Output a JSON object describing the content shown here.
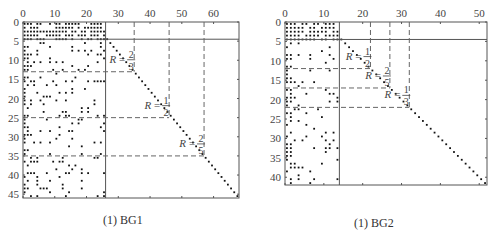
{
  "figures": [
    {
      "id": "bg1",
      "caption": "(1) BG1",
      "x_ticks": [
        "0",
        "10",
        "20",
        "30",
        "40",
        "50",
        "60"
      ],
      "y_ticks": [
        "0",
        "5",
        "10",
        "15",
        "20",
        "25",
        "30",
        "35",
        "40",
        "45"
      ],
      "rate_labels": [
        {
          "r": "R",
          "eq": "=",
          "num": "2",
          "den": "3"
        },
        {
          "r": "R",
          "eq": "=",
          "num": "1",
          "den": "2"
        },
        {
          "r": "R",
          "eq": "=",
          "num": "2",
          "den": "5"
        }
      ]
    },
    {
      "id": "bg2",
      "caption": "(1) BG2",
      "x_ticks": [
        "0",
        "10",
        "20",
        "30",
        "40",
        "50"
      ],
      "y_ticks": [
        "0",
        "5",
        "10",
        "15",
        "20",
        "25",
        "30",
        "35",
        "40"
      ],
      "rate_labels": [
        {
          "r": "R",
          "eq": "=",
          "num": "1",
          "den": "2"
        },
        {
          "r": "R",
          "eq": "=",
          "num": "2",
          "den": "5"
        },
        {
          "r": "R",
          "eq": "=",
          "num": "1",
          "den": "3"
        }
      ]
    }
  ],
  "chart_data": [
    {
      "type": "scatter",
      "title": "BG1 base graph (LDPC) non-zero pattern",
      "caption": "(1) BG1",
      "x_range": [
        0,
        68
      ],
      "y_range": [
        0,
        46
      ],
      "x_ticks": [
        0,
        10,
        20,
        30,
        40,
        50,
        60
      ],
      "y_ticks": [
        0,
        5,
        10,
        15,
        20,
        25,
        30,
        35,
        40,
        45
      ],
      "core_block": {
        "rows": [
          0,
          4
        ],
        "cols": [
          0,
          26
        ]
      },
      "info_cols": 22,
      "diagonal": {
        "from": [
          26,
          4
        ],
        "to": [
          68,
          46
        ]
      },
      "rate_cuts": [
        {
          "label": "R=2/3",
          "row": 13,
          "col": 35
        },
        {
          "label": "R=1/2",
          "row": 25,
          "col": 46
        },
        {
          "label": "R=2/5",
          "row": 35,
          "col": 57
        }
      ]
    },
    {
      "type": "scatter",
      "title": "BG2 base graph (LDPC) non-zero pattern",
      "caption": "(1) BG2",
      "x_range": [
        0,
        52
      ],
      "y_range": [
        0,
        42
      ],
      "x_ticks": [
        0,
        10,
        20,
        30,
        40,
        50
      ],
      "y_ticks": [
        0,
        5,
        10,
        15,
        20,
        25,
        30,
        35,
        40
      ],
      "core_block": {
        "rows": [
          0,
          4
        ],
        "cols": [
          0,
          14
        ]
      },
      "info_cols": 10,
      "diagonal": {
        "from": [
          14,
          4
        ],
        "to": [
          52,
          42
        ]
      },
      "rate_cuts": [
        {
          "label": "R=1/2",
          "row": 12,
          "col": 22
        },
        {
          "label": "R=2/5",
          "row": 17,
          "col": 27
        },
        {
          "label": "R=1/3",
          "row": 22,
          "col": 32
        }
      ]
    }
  ]
}
